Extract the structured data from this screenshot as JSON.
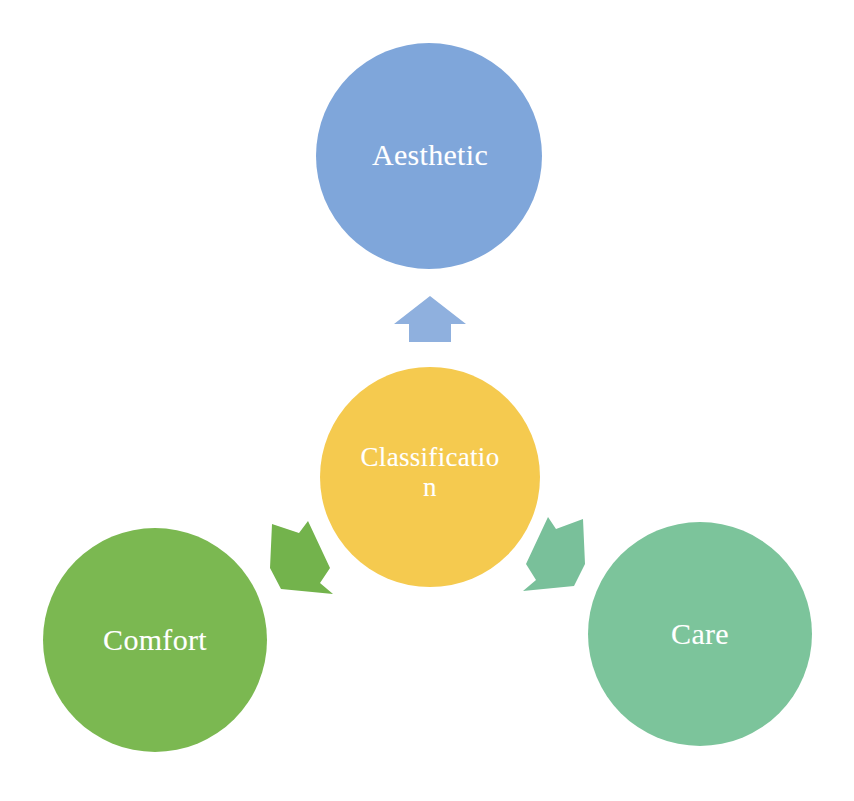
{
  "diagram": {
    "type": "hub-and-spoke",
    "background_color": "#ffffff",
    "width": 854,
    "height": 801,
    "center_node": {
      "id": "classification",
      "label": "Classification",
      "label_line_1": "Classificatio",
      "label_line_2": "n",
      "shape": "circle",
      "color": "#f5ca4f",
      "text_color": "#ffffff",
      "cx": 430,
      "cy": 477,
      "r": 110
    },
    "nodes": [
      {
        "id": "aesthetic",
        "label": "Aesthetic",
        "shape": "circle",
        "color": "#7fa6da",
        "text_color": "#ffffff",
        "cx": 429,
        "cy": 156,
        "r": 113,
        "position": "top"
      },
      {
        "id": "comfort",
        "label": "Comfort",
        "shape": "circle",
        "color": "#7bb851",
        "text_color": "#ffffff",
        "cx": 155,
        "cy": 640,
        "r": 112,
        "position": "bottom-left"
      },
      {
        "id": "care",
        "label": "Care",
        "shape": "circle",
        "color": "#7cc49b",
        "text_color": "#ffffff",
        "cx": 700,
        "cy": 634,
        "r": 112,
        "position": "bottom-right"
      }
    ],
    "arrows": [
      {
        "id": "arrow-up",
        "from": "classification",
        "to": "aesthetic",
        "direction": "up",
        "color": "#8fb0de"
      },
      {
        "id": "arrow-down-left",
        "from": "classification",
        "to": "comfort",
        "direction": "down-left",
        "color": "#73b34c"
      },
      {
        "id": "arrow-down-right",
        "from": "classification",
        "to": "care",
        "direction": "down-right",
        "color": "#79c09a"
      }
    ]
  }
}
